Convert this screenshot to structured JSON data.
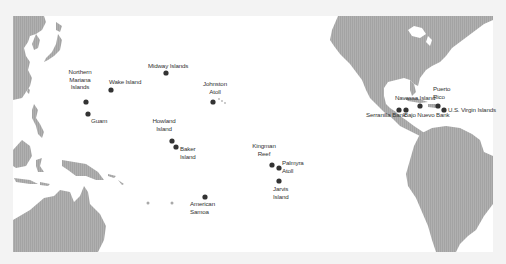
{
  "map": {
    "title": "US territories in the Pacific and Caribbean",
    "colors": {
      "background": "#f3f3f3",
      "ocean": "#ffffff",
      "land": "#a9a9a9",
      "marker": "#333333",
      "label": "#333333"
    },
    "markers": [
      {
        "id": "northern-mariana-islands",
        "label_lines": [
          "Northern",
          "Mariana",
          "Islands"
        ],
        "x": 86,
        "y": 102
      },
      {
        "id": "guam",
        "label_lines": [
          "Guam"
        ],
        "x": 88,
        "y": 114
      },
      {
        "id": "wake-island",
        "label_lines": [
          "Wake Island"
        ],
        "x": 111,
        "y": 90
      },
      {
        "id": "midway-islands",
        "label_lines": [
          "Midway Islands"
        ],
        "x": 166,
        "y": 73
      },
      {
        "id": "johnston-atoll",
        "label_lines": [
          "Johnston",
          "Atoll"
        ],
        "x": 213,
        "y": 102
      },
      {
        "id": "howland-island",
        "label_lines": [
          "Howland",
          "Island"
        ],
        "x": 172,
        "y": 141
      },
      {
        "id": "baker-island",
        "label_lines": [
          "Baker",
          "Island"
        ],
        "x": 176,
        "y": 147
      },
      {
        "id": "american-samoa",
        "label_lines": [
          "American",
          "Samoa"
        ],
        "x": 205,
        "y": 197
      },
      {
        "id": "kingman-reef",
        "label_lines": [
          "Kingman",
          "Reef"
        ],
        "x": 272,
        "y": 165
      },
      {
        "id": "palmyra-atoll",
        "label_lines": [
          "Palmyra",
          "Atoll"
        ],
        "x": 279,
        "y": 168
      },
      {
        "id": "jarvis-island",
        "label_lines": [
          "Jarvis",
          "Island"
        ],
        "x": 279,
        "y": 181
      },
      {
        "id": "serranilla-bank",
        "label_lines": [
          "Serranilla Bank"
        ],
        "x": 399,
        "y": 110
      },
      {
        "id": "bajo-nuevo-bank",
        "label_lines": [
          "Bajo Nuevo Bank"
        ],
        "x": 406,
        "y": 110
      },
      {
        "id": "navassa-island",
        "label_lines": [
          "Navassa Island"
        ],
        "x": 420,
        "y": 106
      },
      {
        "id": "puerto-rico",
        "label_lines": [
          "Puerto",
          "Rico"
        ],
        "x": 438,
        "y": 106
      },
      {
        "id": "us-virgin-islands",
        "label_lines": [
          "U.S. Virgin Islands"
        ],
        "x": 444,
        "y": 110
      }
    ]
  }
}
